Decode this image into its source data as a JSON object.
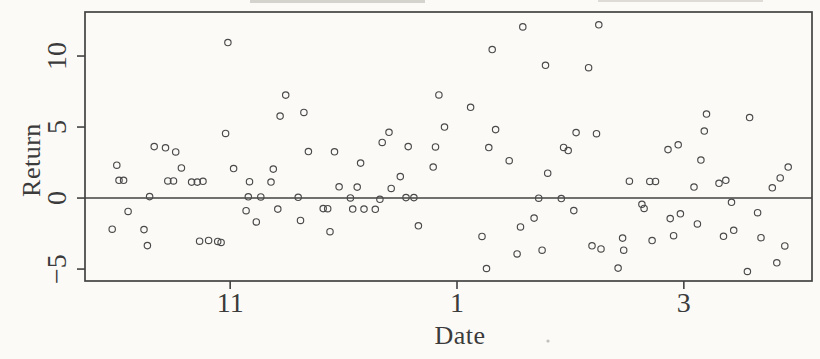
{
  "figure": {
    "background": "#fbfaf7",
    "ink_color": "#424242",
    "marker_color": "#4a4a4a"
  },
  "chart_data": {
    "type": "scatter",
    "title": "",
    "xlabel": "Date",
    "ylabel": "Return",
    "grid": false,
    "legend": null,
    "marker": "open-circle",
    "x_axis": {
      "note": "continuous month scale: 11 = November, 13 shown as '1' (January), 15 shown as '3' (March)",
      "range": [
        9.72,
        16.13
      ],
      "ticks": [
        {
          "value": 11,
          "label": "11"
        },
        {
          "value": 13,
          "label": "1"
        },
        {
          "value": 15,
          "label": "3"
        }
      ]
    },
    "y_axis": {
      "range": [
        -5.84,
        13.1
      ],
      "ticks": [
        {
          "value": -5,
          "label": "−5"
        },
        {
          "value": 0,
          "label": "0"
        },
        {
          "value": 5,
          "label": "5"
        },
        {
          "value": 10,
          "label": "10"
        }
      ]
    },
    "hline": {
      "y": 0
    },
    "points": [
      [
        9.96,
        -2.19
      ],
      [
        10.0,
        2.31
      ],
      [
        10.02,
        1.25
      ],
      [
        10.06,
        1.25
      ],
      [
        10.1,
        -0.94
      ],
      [
        10.24,
        -2.22
      ],
      [
        10.27,
        -3.35
      ],
      [
        10.29,
        0.1
      ],
      [
        10.33,
        3.62
      ],
      [
        10.43,
        3.54
      ],
      [
        10.45,
        1.21
      ],
      [
        10.5,
        1.21
      ],
      [
        10.52,
        3.25
      ],
      [
        10.57,
        2.12
      ],
      [
        10.66,
        1.12
      ],
      [
        10.71,
        1.12
      ],
      [
        10.73,
        -3.04
      ],
      [
        10.76,
        1.18
      ],
      [
        10.81,
        -2.98
      ],
      [
        10.89,
        -3.05
      ],
      [
        10.92,
        -3.12
      ],
      [
        10.96,
        4.55
      ],
      [
        10.98,
        10.95
      ],
      [
        11.03,
        2.08
      ],
      [
        11.14,
        -0.89
      ],
      [
        11.16,
        0.09
      ],
      [
        11.17,
        1.15
      ],
      [
        11.23,
        -1.68
      ],
      [
        11.27,
        0.08
      ],
      [
        11.36,
        1.13
      ],
      [
        11.38,
        2.04
      ],
      [
        11.42,
        -0.78
      ],
      [
        11.44,
        5.77
      ],
      [
        11.49,
        7.25
      ],
      [
        11.6,
        0.05
      ],
      [
        11.62,
        -1.57
      ],
      [
        11.65,
        6.03
      ],
      [
        11.69,
        3.28
      ],
      [
        11.82,
        -0.74
      ],
      [
        11.86,
        -0.75
      ],
      [
        11.88,
        -2.37
      ],
      [
        11.92,
        3.26
      ],
      [
        11.96,
        0.79
      ],
      [
        12.06,
        0.01
      ],
      [
        12.08,
        -0.77
      ],
      [
        12.12,
        0.77
      ],
      [
        12.15,
        2.46
      ],
      [
        12.18,
        -0.78
      ],
      [
        12.28,
        -0.79
      ],
      [
        12.32,
        -0.09
      ],
      [
        12.34,
        3.92
      ],
      [
        12.4,
        4.63
      ],
      [
        12.42,
        0.68
      ],
      [
        12.5,
        1.51
      ],
      [
        12.55,
        0.03
      ],
      [
        12.57,
        3.62
      ],
      [
        12.62,
        0.03
      ],
      [
        12.66,
        -1.95
      ],
      [
        12.79,
        2.19
      ],
      [
        12.81,
        3.6
      ],
      [
        12.84,
        7.26
      ],
      [
        12.89,
        5.0
      ],
      [
        13.12,
        6.39
      ],
      [
        13.22,
        -2.7
      ],
      [
        13.26,
        -4.96
      ],
      [
        13.28,
        3.56
      ],
      [
        13.31,
        10.46
      ],
      [
        13.34,
        4.82
      ],
      [
        13.46,
        2.63
      ],
      [
        13.53,
        -3.93
      ],
      [
        13.56,
        -2.03
      ],
      [
        13.58,
        12.05
      ],
      [
        13.68,
        -1.41
      ],
      [
        13.72,
        -0.01
      ],
      [
        13.75,
        -3.67
      ],
      [
        13.78,
        9.35
      ],
      [
        13.8,
        1.75
      ],
      [
        13.92,
        -0.03
      ],
      [
        13.94,
        3.57
      ],
      [
        13.98,
        3.35
      ],
      [
        14.03,
        -0.88
      ],
      [
        14.05,
        4.61
      ],
      [
        14.16,
        9.18
      ],
      [
        14.19,
        -3.36
      ],
      [
        14.23,
        4.53
      ],
      [
        14.25,
        12.2
      ],
      [
        14.27,
        -3.58
      ],
      [
        14.42,
        -4.93
      ],
      [
        14.46,
        -2.82
      ],
      [
        14.47,
        -3.67
      ],
      [
        14.52,
        1.19
      ],
      [
        14.63,
        -0.44
      ],
      [
        14.65,
        -0.73
      ],
      [
        14.7,
        1.17
      ],
      [
        14.72,
        -2.99
      ],
      [
        14.75,
        1.17
      ],
      [
        14.86,
        3.41
      ],
      [
        14.88,
        -1.45
      ],
      [
        14.91,
        -2.65
      ],
      [
        14.95,
        3.75
      ],
      [
        14.97,
        -1.11
      ],
      [
        15.09,
        0.78
      ],
      [
        15.12,
        -1.82
      ],
      [
        15.15,
        2.68
      ],
      [
        15.18,
        4.72
      ],
      [
        15.2,
        5.92
      ],
      [
        15.31,
        1.04
      ],
      [
        15.35,
        -2.69
      ],
      [
        15.37,
        1.25
      ],
      [
        15.42,
        -0.3
      ],
      [
        15.44,
        -2.27
      ],
      [
        15.56,
        -5.17
      ],
      [
        15.58,
        5.67
      ],
      [
        15.65,
        -1.03
      ],
      [
        15.68,
        -2.79
      ],
      [
        15.78,
        0.72
      ],
      [
        15.82,
        -4.56
      ],
      [
        15.85,
        1.42
      ],
      [
        15.89,
        -3.37
      ],
      [
        15.92,
        2.19
      ]
    ]
  }
}
